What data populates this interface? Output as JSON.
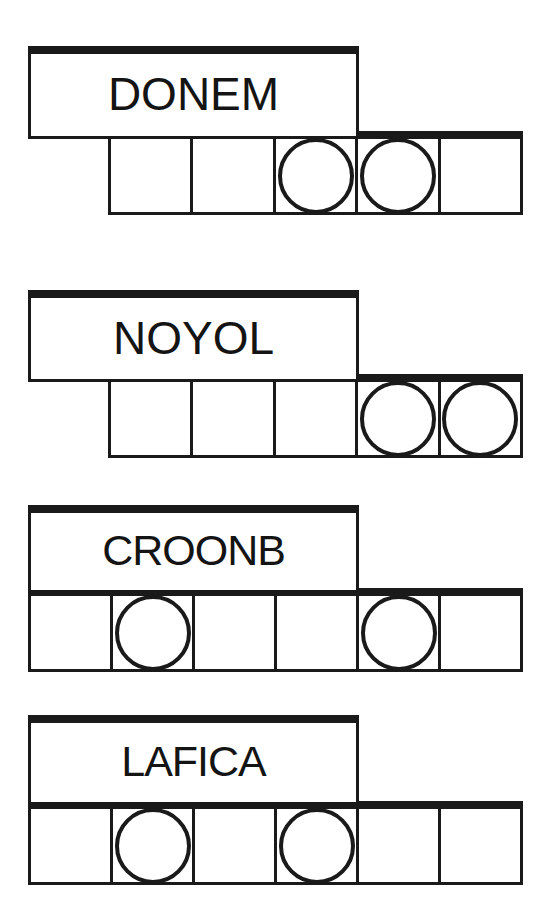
{
  "figure": {
    "type": "word-segmentation-diagram",
    "background_color": "#ffffff",
    "ink_color": "#1a1a1a",
    "group_count": 4
  },
  "groups": [
    {
      "label": "DONEM",
      "letter_count": 5,
      "cell_count": 5,
      "circled_positions": [
        3,
        4
      ],
      "cells": [
        {
          "index": 1,
          "circled": false
        },
        {
          "index": 2,
          "circled": false
        },
        {
          "index": 3,
          "circled": true
        },
        {
          "index": 4,
          "circled": true
        },
        {
          "index": 5,
          "circled": false
        }
      ],
      "label_box": {
        "x": 28,
        "y": 46,
        "width": 331,
        "height": 93
      },
      "cell_row": {
        "x": 108,
        "y": 131,
        "width": 415,
        "height": 84
      }
    },
    {
      "label": "NOYOL",
      "letter_count": 5,
      "cell_count": 5,
      "circled_positions": [
        4,
        5
      ],
      "cells": [
        {
          "index": 1,
          "circled": false
        },
        {
          "index": 2,
          "circled": false
        },
        {
          "index": 3,
          "circled": false
        },
        {
          "index": 4,
          "circled": true
        },
        {
          "index": 5,
          "circled": true
        }
      ],
      "label_box": {
        "x": 28,
        "y": 290,
        "width": 331,
        "height": 92
      },
      "cell_row": {
        "x": 108,
        "y": 374,
        "width": 415,
        "height": 84
      }
    },
    {
      "label": "CROONB",
      "letter_count": 6,
      "cell_count": 6,
      "circled_positions": [
        2,
        5
      ],
      "cells": [
        {
          "index": 1,
          "circled": false
        },
        {
          "index": 2,
          "circled": true
        },
        {
          "index": 3,
          "circled": false
        },
        {
          "index": 4,
          "circled": false
        },
        {
          "index": 5,
          "circled": true
        },
        {
          "index": 6,
          "circled": false
        }
      ],
      "label_box": {
        "x": 28,
        "y": 505,
        "width": 331,
        "height": 88
      },
      "cell_row": {
        "x": 28,
        "y": 588,
        "width": 495,
        "height": 84
      }
    },
    {
      "label": "LAFICA",
      "letter_count": 6,
      "cell_count": 6,
      "circled_positions": [
        2,
        4
      ],
      "cells": [
        {
          "index": 1,
          "circled": false
        },
        {
          "index": 2,
          "circled": true
        },
        {
          "index": 3,
          "circled": false
        },
        {
          "index": 4,
          "circled": true
        },
        {
          "index": 5,
          "circled": false
        },
        {
          "index": 6,
          "circled": false
        }
      ],
      "label_box": {
        "x": 28,
        "y": 715,
        "width": 331,
        "height": 90
      },
      "cell_row": {
        "x": 28,
        "y": 801,
        "width": 495,
        "height": 84
      }
    }
  ]
}
